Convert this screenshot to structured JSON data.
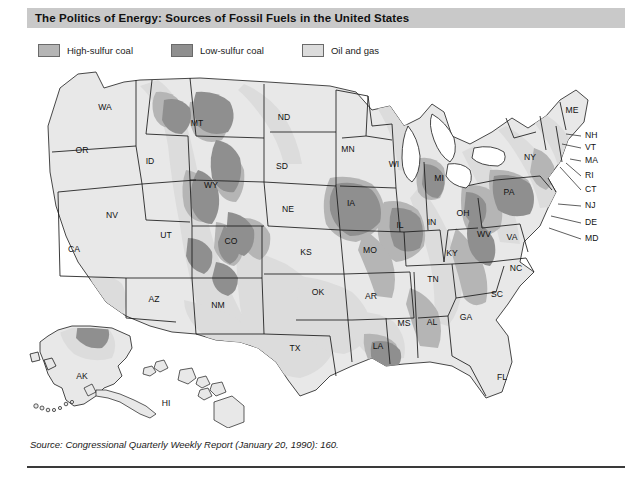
{
  "figure": {
    "title": "The Politics of Energy: Sources of Fossil Fuels in the United States",
    "source": "Source: Congressional Quarterly Weekly Report (January 20, 1990): 160."
  },
  "colors": {
    "title_bar": "#c9c9c9",
    "high_sulfur_coal": "#b5b5b5",
    "low_sulfur_coal": "#8f8f8f",
    "oil_and_gas": "#dcdcdc",
    "state_fill": "#e8e8e8",
    "outline": "#1a1a1a",
    "rule": "#3a3a3a"
  },
  "legend": {
    "items": [
      {
        "label": "High-sulfur coal",
        "swatch": "#b5b5b5",
        "key": "high-sulfur-coal"
      },
      {
        "label": "Low-sulfur coal",
        "swatch": "#8f8f8f",
        "key": "low-sulfur-coal"
      },
      {
        "label": "Oil and gas",
        "swatch": "#dcdcdc",
        "key": "oil-and-gas"
      }
    ]
  },
  "map": {
    "states": [
      {
        "code": "WA",
        "name": "Washington",
        "lx": 105,
        "ly": 42
      },
      {
        "code": "OR",
        "name": "Oregon",
        "lx": 82,
        "ly": 85
      },
      {
        "code": "ID",
        "name": "Idaho",
        "lx": 150,
        "ly": 96
      },
      {
        "code": "MT",
        "name": "Montana",
        "lx": 197,
        "ly": 58
      },
      {
        "code": "WY",
        "name": "Wyoming",
        "lx": 211,
        "ly": 120
      },
      {
        "code": "ND",
        "name": "North Dakota",
        "lx": 284,
        "ly": 52
      },
      {
        "code": "SD",
        "name": "South Dakota",
        "lx": 282,
        "ly": 101
      },
      {
        "code": "NE",
        "name": "Nebraska",
        "lx": 288,
        "ly": 144
      },
      {
        "code": "MN",
        "name": "Minnesota",
        "lx": 348,
        "ly": 84
      },
      {
        "code": "WI",
        "name": "Wisconsin",
        "lx": 394,
        "ly": 99
      },
      {
        "code": "IA",
        "name": "Iowa",
        "lx": 351,
        "ly": 138
      },
      {
        "code": "IL",
        "name": "Illinois",
        "lx": 400,
        "ly": 160
      },
      {
        "code": "IN",
        "name": "Indiana",
        "lx": 432,
        "ly": 157
      },
      {
        "code": "MI",
        "name": "Michigan",
        "lx": 439,
        "ly": 113
      },
      {
        "code": "OH",
        "name": "Ohio",
        "lx": 463,
        "ly": 148
      },
      {
        "code": "NV",
        "name": "Nevada",
        "lx": 112,
        "ly": 150
      },
      {
        "code": "CA",
        "name": "California",
        "lx": 74,
        "ly": 184
      },
      {
        "code": "UT",
        "name": "Utah",
        "lx": 166,
        "ly": 170
      },
      {
        "code": "CO",
        "name": "Colorado",
        "lx": 231,
        "ly": 176
      },
      {
        "code": "AZ",
        "name": "Arizona",
        "lx": 154,
        "ly": 234
      },
      {
        "code": "NM",
        "name": "New Mexico",
        "lx": 218,
        "ly": 240
      },
      {
        "code": "KS",
        "name": "Kansas",
        "lx": 306,
        "ly": 187
      },
      {
        "code": "MO",
        "name": "Missouri",
        "lx": 370,
        "ly": 185
      },
      {
        "code": "OK",
        "name": "Oklahoma",
        "lx": 318,
        "ly": 227
      },
      {
        "code": "AR",
        "name": "Arkansas",
        "lx": 371,
        "ly": 231
      },
      {
        "code": "TX",
        "name": "Texas",
        "lx": 295,
        "ly": 283
      },
      {
        "code": "LA",
        "name": "Louisiana",
        "lx": 378,
        "ly": 281
      },
      {
        "code": "MS",
        "name": "Mississippi",
        "lx": 404,
        "ly": 258
      },
      {
        "code": "AL",
        "name": "Alabama",
        "lx": 432,
        "ly": 257
      },
      {
        "code": "TN",
        "name": "Tennessee",
        "lx": 433,
        "ly": 214
      },
      {
        "code": "KY",
        "name": "Kentucky",
        "lx": 452,
        "ly": 188
      },
      {
        "code": "GA",
        "name": "Georgia",
        "lx": 466,
        "ly": 252
      },
      {
        "code": "FL",
        "name": "Florida",
        "lx": 502,
        "ly": 312
      },
      {
        "code": "SC",
        "name": "South Carolina",
        "lx": 497,
        "ly": 229
      },
      {
        "code": "NC",
        "name": "North Carolina",
        "lx": 516,
        "ly": 203
      },
      {
        "code": "VA",
        "name": "Virginia",
        "lx": 512,
        "ly": 172
      },
      {
        "code": "WV",
        "name": "West Virginia",
        "lx": 484,
        "ly": 169
      },
      {
        "code": "PA",
        "name": "Pennsylvania",
        "lx": 509,
        "ly": 127
      },
      {
        "code": "NY",
        "name": "New York",
        "lx": 530,
        "ly": 92
      },
      {
        "code": "ME",
        "name": "Maine",
        "lx": 572,
        "ly": 45
      },
      {
        "code": "AK",
        "name": "Alaska",
        "lx": 82,
        "ly": 311
      },
      {
        "code": "HI",
        "name": "Hawaii",
        "lx": 166,
        "ly": 338
      }
    ],
    "callouts": [
      {
        "code": "NH",
        "name": "New Hampshire",
        "tx": 585,
        "ty": 70,
        "x1": 566,
        "y1": 68,
        "x2": 581,
        "y2": 70
      },
      {
        "code": "VT",
        "name": "Vermont",
        "tx": 585,
        "ty": 82,
        "x1": 562,
        "y1": 78,
        "x2": 581,
        "y2": 82
      },
      {
        "code": "MA",
        "name": "Massachusetts",
        "tx": 585,
        "ty": 95,
        "x1": 570,
        "y1": 93,
        "x2": 581,
        "y2": 95
      },
      {
        "code": "RI",
        "name": "Rhode Island",
        "tx": 585,
        "ty": 110,
        "x1": 566,
        "y1": 97,
        "x2": 581,
        "y2": 110
      },
      {
        "code": "CT",
        "name": "Connecticut",
        "tx": 585,
        "ty": 124,
        "x1": 560,
        "y1": 101,
        "x2": 581,
        "y2": 124
      },
      {
        "code": "NJ",
        "name": "New Jersey",
        "tx": 585,
        "ty": 140,
        "x1": 558,
        "y1": 138,
        "x2": 581,
        "y2": 140
      },
      {
        "code": "DE",
        "name": "Delaware",
        "tx": 585,
        "ty": 157,
        "x1": 551,
        "y1": 150,
        "x2": 581,
        "y2": 157
      },
      {
        "code": "MD",
        "name": "Maryland",
        "tx": 585,
        "ty": 173,
        "x1": 549,
        "y1": 160,
        "x2": 581,
        "y2": 173
      }
    ]
  }
}
